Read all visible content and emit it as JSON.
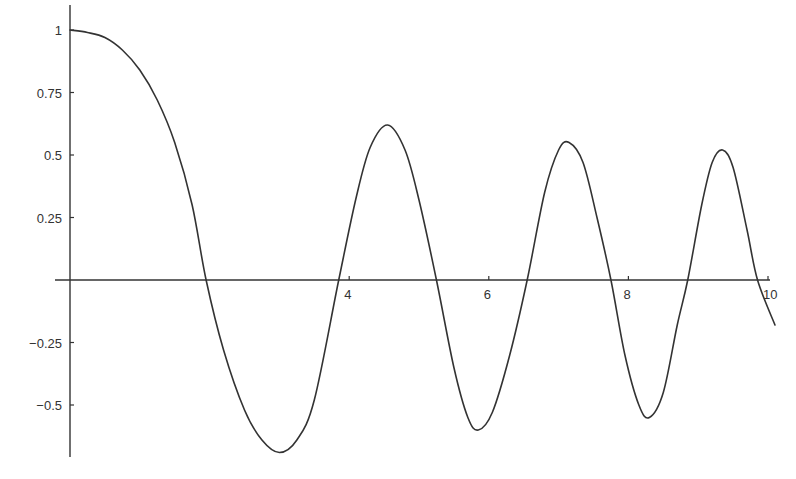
{
  "chart_data": {
    "type": "line",
    "title": "",
    "xlabel": "",
    "ylabel": "",
    "xlim": [
      0,
      10.1
    ],
    "ylim": [
      -0.7,
      1.0
    ],
    "grid": false,
    "legend": null,
    "x_ticks": [
      4,
      6,
      8,
      10
    ],
    "x_tick_labels": [
      "4",
      "6",
      "8",
      "10"
    ],
    "y_ticks": [
      1,
      0.75,
      0.5,
      0.25,
      -0.25,
      -0.5
    ],
    "y_tick_labels": [
      "1",
      "0.75",
      "0.5",
      "0.25",
      "−0.25",
      "−0.5"
    ],
    "line_color": "#333333",
    "series": [
      {
        "name": "f(x)",
        "x": [
          0,
          0.25,
          0.5,
          0.75,
          1.0,
          1.25,
          1.5,
          1.75,
          1.95,
          2.2,
          2.5,
          2.75,
          3.0,
          3.25,
          3.5,
          3.85,
          4.1,
          4.3,
          4.55,
          4.8,
          5.0,
          5.25,
          5.5,
          5.7,
          5.85,
          6.05,
          6.3,
          6.55,
          6.8,
          7.0,
          7.15,
          7.35,
          7.55,
          7.75,
          7.95,
          8.15,
          8.3,
          8.5,
          8.7,
          8.85,
          9.05,
          9.2,
          9.35,
          9.5,
          9.7,
          9.85,
          10.1
        ],
        "y": [
          1.0,
          0.99,
          0.97,
          0.92,
          0.84,
          0.72,
          0.55,
          0.3,
          0.0,
          -0.28,
          -0.52,
          -0.64,
          -0.69,
          -0.64,
          -0.48,
          0.0,
          0.33,
          0.53,
          0.62,
          0.52,
          0.32,
          0.0,
          -0.35,
          -0.55,
          -0.6,
          -0.53,
          -0.3,
          0.0,
          0.35,
          0.52,
          0.55,
          0.47,
          0.25,
          0.0,
          -0.3,
          -0.5,
          -0.55,
          -0.45,
          -0.18,
          0.0,
          0.3,
          0.47,
          0.52,
          0.45,
          0.2,
          0.0,
          -0.18
        ]
      }
    ]
  },
  "plot_area": {
    "x0_px": 70,
    "x_per_unit_px": 69.8,
    "y0_px": 280,
    "y_per_unit_px": 250
  }
}
